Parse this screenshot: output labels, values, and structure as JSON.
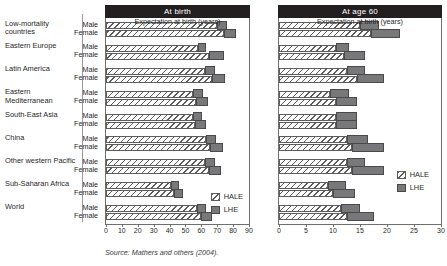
{
  "source_note": "Source: Mathers and others (2004).",
  "legend": {
    "items": [
      {
        "key": "hale",
        "label": "HALE"
      },
      {
        "key": "lhe",
        "label": "LHE"
      }
    ]
  },
  "sex_labels": {
    "male": "Male",
    "female": "Female"
  },
  "region_labels": [
    "Low-mortality countries",
    "Eastern Europe",
    "Latin America",
    "Eastern Mediterranean",
    "South-East Asia",
    "China",
    "Other western Pacific",
    "Sub-Saharan Africa",
    "World"
  ],
  "chart_data": [
    {
      "id": "at-birth",
      "type": "bar",
      "orientation": "horizontal",
      "title": "At birth",
      "xlabel": "Expectation at birth (years)",
      "ylabel": "",
      "xlim": [
        0,
        90
      ],
      "xticks": [
        0,
        10,
        20,
        30,
        40,
        50,
        60,
        70,
        80,
        90
      ],
      "xticklabels": [
        "0",
        "10",
        "20",
        "30",
        "40",
        "50",
        "60",
        "70",
        "80",
        "90"
      ],
      "grid": false,
      "legend_position": "inside-bottom-right",
      "legend": [
        "HALE",
        "LHE"
      ],
      "categories": [
        "Low-mortality countries",
        "Eastern Europe",
        "Latin America",
        "Eastern Mediterranean",
        "South-East Asia",
        "China",
        "Other western Pacific",
        "Sub-Saharan Africa",
        "World"
      ],
      "series": [
        {
          "name": "HALE",
          "sex": "Male",
          "values": [
            70.0,
            58.0,
            62.0,
            55.0,
            54.5,
            63.0,
            62.0,
            41.0,
            57.0
          ]
        },
        {
          "name": "LHE",
          "sex": "Male",
          "values": [
            76.0,
            63.0,
            68.5,
            61.0,
            60.5,
            69.5,
            68.5,
            46.0,
            63.0
          ]
        },
        {
          "name": "HALE",
          "sex": "Female",
          "values": [
            74.0,
            65.0,
            66.5,
            56.5,
            56.0,
            65.5,
            65.0,
            43.0,
            60.0
          ]
        },
        {
          "name": "LHE",
          "sex": "Female",
          "values": [
            82.0,
            74.0,
            75.0,
            64.5,
            63.0,
            73.5,
            72.5,
            48.5,
            67.0
          ]
        }
      ]
    },
    {
      "id": "at-age-60",
      "type": "bar",
      "orientation": "horizontal",
      "title": "At age 60",
      "xlabel": "Expectation at birth (years)",
      "ylabel": "",
      "xlim": [
        0,
        30
      ],
      "xticks": [
        0,
        5,
        10,
        15,
        20,
        25,
        30
      ],
      "xticklabels": [
        "0",
        "5",
        "10",
        "15",
        "20",
        "25",
        "30"
      ],
      "grid": false,
      "legend_position": "inside-bottom-right",
      "legend": [
        "HALE",
        "LHE"
      ],
      "categories": [
        "Low-mortality countries",
        "Eastern Europe",
        "Latin America",
        "Eastern Mediterranean",
        "South-East Asia",
        "China",
        "Other western Pacific",
        "Sub-Saharan Africa",
        "World"
      ],
      "series": [
        {
          "name": "HALE",
          "sex": "Male",
          "values": [
            15.0,
            10.5,
            12.5,
            9.5,
            10.5,
            12.5,
            12.5,
            9.0,
            11.5
          ]
        },
        {
          "name": "LHE",
          "sex": "Male",
          "values": [
            18.5,
            13.0,
            16.0,
            13.0,
            14.5,
            16.5,
            16.0,
            12.5,
            15.0
          ]
        },
        {
          "name": "HALE",
          "sex": "Female",
          "values": [
            17.0,
            12.0,
            14.5,
            10.5,
            10.5,
            13.5,
            13.5,
            10.0,
            12.5
          ]
        },
        {
          "name": "LHE",
          "sex": "Female",
          "values": [
            22.5,
            16.0,
            19.5,
            14.5,
            14.5,
            19.5,
            19.5,
            14.0,
            17.5
          ]
        }
      ]
    }
  ]
}
